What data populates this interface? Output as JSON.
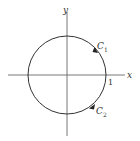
{
  "diagram": {
    "axes": {
      "x_label": "x",
      "y_label": "y"
    },
    "circle": {
      "radius_label": "1"
    },
    "curves": [
      {
        "name": "C",
        "subscript": "1",
        "position": "upper-right"
      },
      {
        "name": "C",
        "subscript": "2",
        "position": "lower-right"
      }
    ],
    "colors": {
      "stroke": "#333333",
      "background": "#ffffff"
    }
  }
}
